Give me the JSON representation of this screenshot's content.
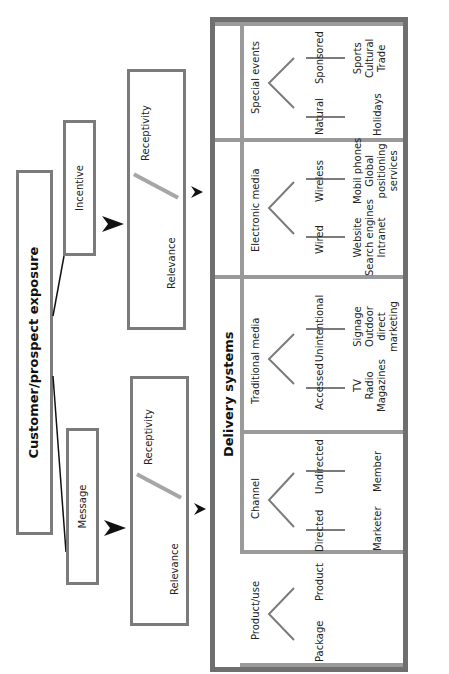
{
  "diagram": {
    "title": "Customer/prospect exposure",
    "branches": [
      {
        "label": "Message",
        "factors": {
          "left": "Relevance",
          "right": "Receptivity"
        }
      },
      {
        "label": "Incentive",
        "factors": {
          "left": "Relevance",
          "right": "Receptivity"
        }
      }
    ],
    "delivery": {
      "title": "Delivery systems",
      "categories": [
        {
          "name": "Product/use",
          "children": [
            {
              "label": "Package",
              "items": ""
            },
            {
              "label": "Product",
              "items": ""
            }
          ]
        },
        {
          "name": "Channel",
          "children": [
            {
              "label": "Directed",
              "items": "Marketer"
            },
            {
              "label": "Undirected",
              "items": "Member"
            }
          ]
        },
        {
          "name": "Traditional media",
          "children": [
            {
              "label": "Accessed",
              "items": "TV\nRadio\nMagazines"
            },
            {
              "label": "Unintentional",
              "items": "Signage\nOutdoor\ndirect\nmarketing"
            }
          ]
        },
        {
          "name": "Electronic media",
          "children": [
            {
              "label": "Wired",
              "items": "Website\nSearch engines\nIntranet"
            },
            {
              "label": "Wireless",
              "items": "Mobil phones\nGlobal\npositioning\nservices"
            }
          ]
        },
        {
          "name": "Special events",
          "children": [
            {
              "label": "Natural",
              "items": "Holidays"
            },
            {
              "label": "Sponsored",
              "items": "Sports\nCultural\nTrade"
            }
          ]
        }
      ]
    }
  },
  "colors": {
    "box_border": "#7b7b7b",
    "outer_border": "#6f6f6f",
    "divider": "#9a9a9a",
    "slash": "#a6a6a6",
    "text": "#222222",
    "arrow": "#111111"
  }
}
